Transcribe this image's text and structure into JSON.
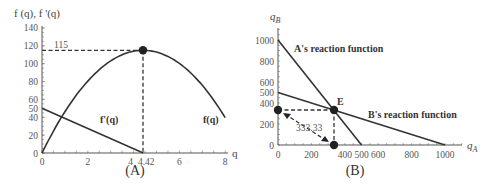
{
  "chart_data": [
    {
      "panel_label": "(A)",
      "type": "line",
      "title": "",
      "xlabel": "q",
      "ylabel": "f (q), f '(q)",
      "xlim": [
        0,
        8
      ],
      "ylim": [
        0,
        140
      ],
      "x_ticks": [
        "0",
        "2",
        "4",
        "4.42",
        "6",
        "8"
      ],
      "y_ticks": [
        "0",
        "20",
        "40",
        "50",
        "60",
        "80",
        "100",
        "120",
        "140"
      ],
      "series": [
        {
          "name": "f(q)",
          "x": [
            0,
            1,
            2,
            3,
            4,
            4.42,
            5,
            6,
            7,
            8
          ],
          "values": [
            0,
            44.4,
            77.4,
            99.2,
            111.5,
            115,
            113.1,
            106.6,
            90.4,
            31
          ]
        },
        {
          "name": "f'(q)",
          "x": [
            0,
            4.42
          ],
          "values": [
            50,
            0
          ]
        }
      ],
      "annotations": [
        {
          "text": "115",
          "x": 0.5,
          "y": 115
        },
        {
          "text": "maximum point",
          "x": 4.42,
          "y": 115
        }
      ],
      "grid": false,
      "legend": "inline labels"
    },
    {
      "panel_label": "(B)",
      "type": "line",
      "title": "",
      "xlabel": "q_A",
      "ylabel": "q_B",
      "xlim": [
        0,
        1000
      ],
      "ylim": [
        0,
        1000
      ],
      "x_ticks": [
        "0",
        "200",
        "400",
        "500",
        "600",
        "800",
        "1000"
      ],
      "y_ticks": [
        "0",
        "200",
        "400",
        "500",
        "600",
        "800",
        "1000"
      ],
      "series": [
        {
          "name": "A's reaction function",
          "x": [
            0,
            500
          ],
          "values": [
            1000,
            0
          ]
        },
        {
          "name": "B's reaction function",
          "x": [
            0,
            1000
          ],
          "values": [
            500,
            0
          ]
        }
      ],
      "points": [
        {
          "label": "E",
          "x": 333.33,
          "y": 333.33
        },
        {
          "label": "",
          "x": 0,
          "y": 333.33
        },
        {
          "label": "",
          "x": 333.33,
          "y": 0
        }
      ],
      "annotations": [
        {
          "text": "333.33",
          "x": 120,
          "y": 160
        },
        {
          "text": "E",
          "x": 333.33,
          "y": 333.33
        }
      ],
      "grid": false,
      "legend": "inline labels"
    }
  ],
  "labels": {
    "a": {
      "ylabel": "f (q), f '(q)",
      "xlabel": "q",
      "panel": "(A)",
      "value_115": "115",
      "fprime": "f'(q)",
      "f": "f(q)",
      "x4_42": "4.42"
    },
    "b": {
      "ylabel_main": "q",
      "ylabel_sub": "B",
      "xlabel_main": "q",
      "xlabel_sub": "A",
      "panel": "(B)",
      "a_reaction": "A's reaction function",
      "b_reaction": "B's reaction function",
      "e": "E",
      "dist": "333.33"
    }
  }
}
